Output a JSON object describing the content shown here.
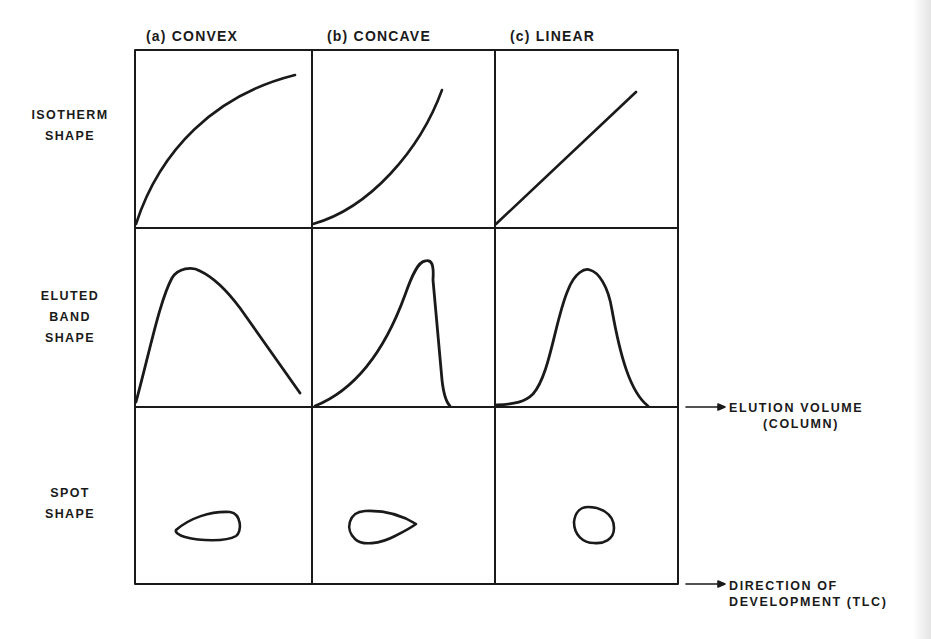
{
  "figure": {
    "cut_off_text_top": "",
    "column_headers": [
      {
        "id": "a",
        "label": "(a) CONVEX"
      },
      {
        "id": "b",
        "label": "(b) CONCAVE"
      },
      {
        "id": "c",
        "label": "(c) LINEAR"
      }
    ],
    "row_labels": [
      {
        "id": "isotherm",
        "lines": [
          "ISOTHERM",
          "SHAPE"
        ]
      },
      {
        "id": "band",
        "lines": [
          "ELUTED",
          "BAND",
          "SHAPE"
        ]
      },
      {
        "id": "spot",
        "lines": [
          "SPOT",
          "SHAPE"
        ]
      }
    ],
    "axis_annotations": [
      {
        "id": "elution",
        "lines": [
          "ELUTION VOLUME",
          "(COLUMN)"
        ]
      },
      {
        "id": "development",
        "lines": [
          "DIRECTION OF",
          "DEVELOPMENT (TLC)"
        ]
      }
    ],
    "cells": {
      "isotherm": [
        "convex-curve",
        "concave-curve",
        "straight-line"
      ],
      "band": [
        "fronting-peak",
        "tailing-peak",
        "symmetric-gaussian-peak"
      ],
      "spot": [
        "teardrop-pointing-left",
        "teardrop-pointing-right",
        "round-spot"
      ]
    },
    "colors": {
      "ink": "#1a1a1a",
      "background": "#ffffff"
    }
  }
}
